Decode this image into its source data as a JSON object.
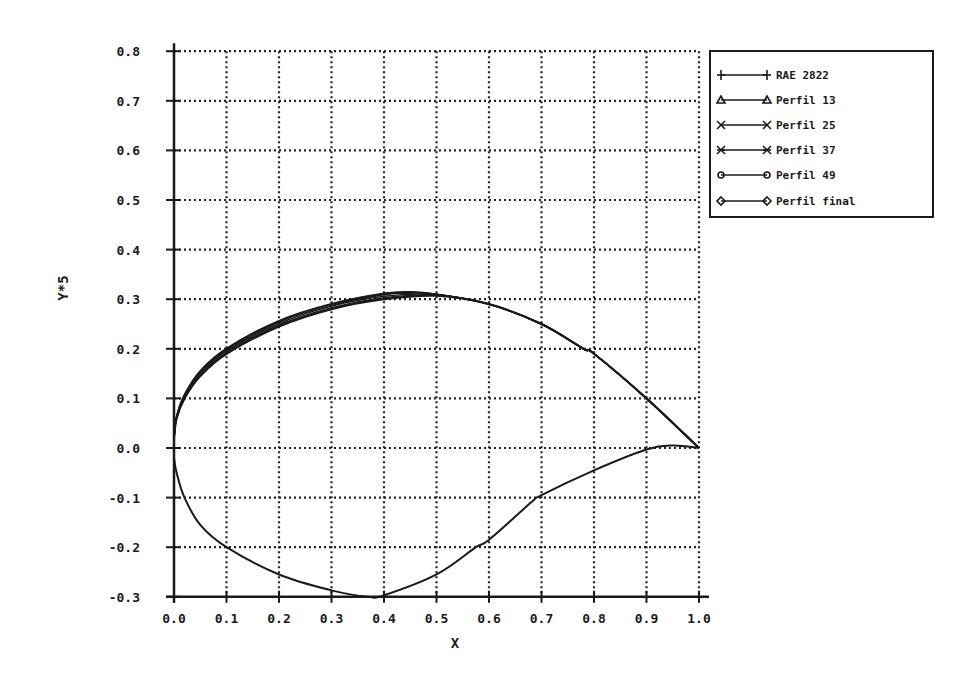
{
  "chart_data": {
    "type": "line",
    "title": "",
    "xlabel": "X",
    "ylabel": "Y*5",
    "xlim": [
      0.0,
      1.0
    ],
    "ylim": [
      -0.3,
      0.8
    ],
    "grid": true,
    "legend_position": "upper right, outside plot",
    "x_ticks": [
      "0.0",
      "0.1",
      "0.2",
      "0.3",
      "0.4",
      "0.5",
      "0.6",
      "0.7",
      "0.8",
      "0.9",
      "1.0"
    ],
    "y_ticks": [
      "0.8",
      "0.7",
      "0.6",
      "0.5",
      "0.4",
      "0.3",
      "0.2",
      "0.1",
      "0.0",
      "-0.1",
      "-0.2",
      "-0.3"
    ],
    "lower_surface": {
      "x": [
        0.0,
        0.005,
        0.02,
        0.05,
        0.1,
        0.2,
        0.3,
        0.37,
        0.4,
        0.5,
        0.575,
        0.6,
        0.68,
        0.7,
        0.8,
        0.9,
        0.95,
        1.0
      ],
      "y": [
        -0.02,
        -0.05,
        -0.1,
        -0.155,
        -0.2,
        -0.255,
        -0.287,
        -0.3,
        -0.297,
        -0.255,
        -0.2,
        -0.185,
        -0.11,
        -0.095,
        -0.045,
        -0.003,
        0.005,
        0.0
      ]
    },
    "series": [
      {
        "name": "RAE 2822",
        "marker": "plus",
        "x": [
          0.0,
          0.005,
          0.02,
          0.05,
          0.1,
          0.2,
          0.3,
          0.4,
          0.5,
          0.6,
          0.7,
          0.78,
          0.8,
          0.9,
          1.0
        ],
        "y": [
          0.02,
          0.06,
          0.1,
          0.145,
          0.19,
          0.245,
          0.28,
          0.3,
          0.307,
          0.29,
          0.25,
          0.2,
          0.19,
          0.1,
          0.0
        ]
      },
      {
        "name": "Perfil 13",
        "marker": "triangle",
        "x": [
          0.0,
          0.005,
          0.02,
          0.05,
          0.1,
          0.2,
          0.3,
          0.4,
          0.5,
          0.6,
          0.7,
          0.78,
          0.8,
          0.9,
          1.0
        ],
        "y": [
          0.02,
          0.061,
          0.102,
          0.148,
          0.193,
          0.248,
          0.283,
          0.303,
          0.308,
          0.29,
          0.25,
          0.2,
          0.19,
          0.1,
          0.0
        ]
      },
      {
        "name": "Perfil 25",
        "marker": "x",
        "x": [
          0.0,
          0.005,
          0.02,
          0.05,
          0.1,
          0.2,
          0.3,
          0.4,
          0.5,
          0.6,
          0.7,
          0.78,
          0.8,
          0.9,
          1.0
        ],
        "y": [
          0.02,
          0.062,
          0.104,
          0.151,
          0.196,
          0.251,
          0.286,
          0.306,
          0.309,
          0.29,
          0.25,
          0.2,
          0.19,
          0.1,
          0.0
        ]
      },
      {
        "name": "Perfil 37",
        "marker": "asterisk",
        "x": [
          0.0,
          0.005,
          0.02,
          0.05,
          0.1,
          0.2,
          0.3,
          0.4,
          0.45,
          0.5,
          0.6,
          0.7,
          0.78,
          0.8,
          0.9,
          1.0
        ],
        "y": [
          0.02,
          0.063,
          0.106,
          0.153,
          0.198,
          0.254,
          0.288,
          0.309,
          0.312,
          0.31,
          0.29,
          0.25,
          0.2,
          0.19,
          0.1,
          0.0
        ]
      },
      {
        "name": "Perfil 49",
        "marker": "octagon",
        "x": [
          0.0,
          0.005,
          0.02,
          0.05,
          0.1,
          0.2,
          0.3,
          0.4,
          0.45,
          0.5,
          0.6,
          0.7,
          0.78,
          0.8,
          0.9,
          1.0
        ],
        "y": [
          0.02,
          0.064,
          0.107,
          0.155,
          0.2,
          0.256,
          0.29,
          0.311,
          0.314,
          0.31,
          0.29,
          0.25,
          0.2,
          0.19,
          0.1,
          0.0
        ]
      },
      {
        "name": "Perfil final",
        "marker": "diamond",
        "x": [
          0.0,
          0.005,
          0.02,
          0.05,
          0.1,
          0.2,
          0.3,
          0.4,
          0.45,
          0.5,
          0.6,
          0.7,
          0.78,
          0.8,
          0.9,
          1.0
        ],
        "y": [
          0.02,
          0.064,
          0.108,
          0.156,
          0.201,
          0.257,
          0.291,
          0.312,
          0.315,
          0.31,
          0.29,
          0.25,
          0.2,
          0.19,
          0.1,
          0.0
        ]
      }
    ]
  },
  "axes": {
    "x_title": "X",
    "y_title": "Y*5"
  },
  "legend": {
    "items": [
      {
        "label": "RAE 2822",
        "marker": "plus"
      },
      {
        "label": "Perfil 13",
        "marker": "triangle"
      },
      {
        "label": "Perfil 25",
        "marker": "x"
      },
      {
        "label": "Perfil 37",
        "marker": "asterisk"
      },
      {
        "label": "Perfil 49",
        "marker": "octagon"
      },
      {
        "label": "Perfil final",
        "marker": "diamond"
      }
    ]
  },
  "colors": {
    "ink": "#1a1a1a",
    "grid": "#222222",
    "background": "#ffffff"
  }
}
